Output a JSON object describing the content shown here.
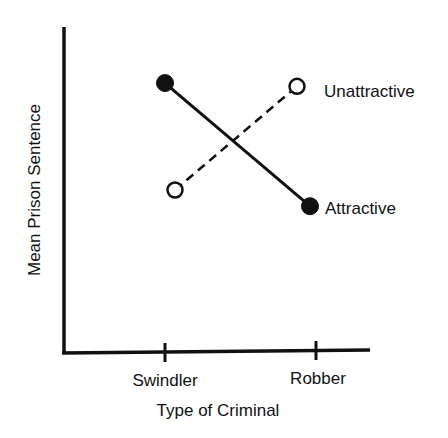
{
  "chart_data": {
    "type": "line",
    "title": "",
    "xlabel": "Type of Criminal",
    "ylabel": "Mean Prison Sentence",
    "categories": [
      "Swindler",
      "Robber"
    ],
    "y_scale": "unlabeled (relative, 0-100 of plot height)",
    "ylim": [
      0,
      100
    ],
    "grid": false,
    "legend_position": "inline-right",
    "series": [
      {
        "name": "Attractive",
        "marker": "filled-circle",
        "line_style": "solid",
        "values": [
          83,
          45
        ]
      },
      {
        "name": "Unattractive",
        "marker": "open-circle",
        "line_style": "dashed",
        "values": [
          50,
          82
        ]
      }
    ]
  },
  "colors": {
    "ink": "#111111",
    "background": "#ffffff"
  }
}
